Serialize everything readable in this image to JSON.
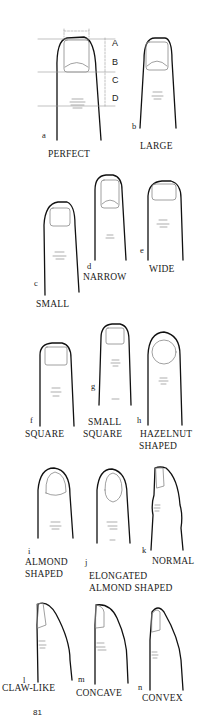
{
  "figure": {
    "page_number": "81",
    "dimension_labels": [
      "A",
      "B",
      "C",
      "D"
    ],
    "panels": [
      {
        "letter": "a",
        "label_lines": [
          "PERFECT"
        ]
      },
      {
        "letter": "b",
        "label_lines": [
          "LARGE"
        ]
      },
      {
        "letter": "c",
        "label_lines": [
          "SMALL"
        ]
      },
      {
        "letter": "d",
        "label_lines": [
          "NARROW"
        ]
      },
      {
        "letter": "e",
        "label_lines": [
          "WIDE"
        ]
      },
      {
        "letter": "f",
        "label_lines": [
          "SQUARE"
        ]
      },
      {
        "letter": "g",
        "label_lines": [
          "SMALL",
          "SQUARE"
        ]
      },
      {
        "letter": "h",
        "label_lines": [
          "HAZELNUT",
          "SHAPED"
        ]
      },
      {
        "letter": "i",
        "label_lines": [
          "ALMOND",
          "SHAPED"
        ]
      },
      {
        "letter": "j",
        "label_lines": [
          "ELONGATED",
          "ALMOND SHAPED"
        ]
      },
      {
        "letter": "k",
        "label_lines": [
          "NORMAL"
        ]
      },
      {
        "letter": "l",
        "label_lines": [
          "CLAW-LIKE"
        ]
      },
      {
        "letter": "m",
        "label_lines": [
          "CONCAVE"
        ]
      },
      {
        "letter": "n",
        "label_lines": [
          "CONVEX"
        ]
      }
    ]
  },
  "colors": {
    "outline": "#111111",
    "nail": "#8a8a8a",
    "guide": "#999999",
    "background": "#ffffff"
  }
}
